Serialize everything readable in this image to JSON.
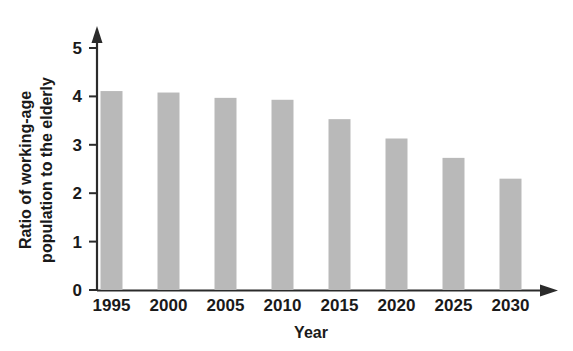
{
  "chart_data": {
    "type": "bar",
    "title": "",
    "subtitle": "",
    "xlabel": "Year",
    "ylabel": "Ratio of working-age population to the elderly",
    "ylabel_line1": "Ratio of working-age",
    "ylabel_line2": "population to the elderly",
    "categories": [
      "1995",
      "2000",
      "2005",
      "2010",
      "2015",
      "2020",
      "2025",
      "2030"
    ],
    "values": [
      4.11,
      4.08,
      3.97,
      3.93,
      3.53,
      3.13,
      2.73,
      2.3
    ],
    "ylim": [
      0,
      5
    ],
    "yticks": [
      "0",
      "1",
      "2",
      "3",
      "4",
      "5"
    ],
    "ytick_values": [
      0,
      1,
      2,
      3,
      4,
      5
    ],
    "grid": false,
    "legend": null,
    "legend_position": "none",
    "bar_color": "#b9b9b9",
    "axis_color": "#2b2b2b",
    "axis_arrows": {
      "x_axis_arrow": "arrow-right",
      "y_axis_arrow": "arrow-up"
    }
  }
}
